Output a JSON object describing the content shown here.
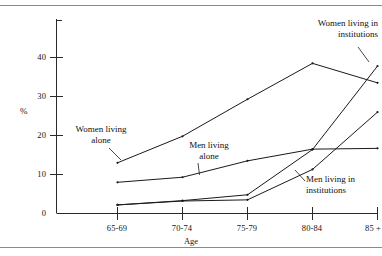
{
  "chart_data": {
    "type": "line",
    "title": "",
    "xlabel": "Age",
    "ylabel": "%",
    "categories": [
      "65-69",
      "70-74",
      "75-79",
      "80-84",
      "85 +"
    ],
    "ylim": [
      0,
      48
    ],
    "xlim": [
      0,
      4
    ],
    "yticks": [
      0,
      10,
      20,
      30,
      40
    ],
    "ytick_labels": [
      "0",
      "10",
      "20",
      "30",
      "40"
    ],
    "grid": false,
    "legend": "annotations-inline",
    "series": [
      {
        "name": "Women living alone",
        "values": [
          13.0,
          19.8,
          29.3,
          38.5,
          33.5
        ],
        "color": "#1a1a1a"
      },
      {
        "name": "Men living alone",
        "values": [
          8.0,
          9.3,
          13.5,
          16.5,
          16.7
        ],
        "color": "#1a1a1a"
      },
      {
        "name": "Women living in institutions",
        "values": [
          2.2,
          3.3,
          4.8,
          16.4,
          37.8
        ],
        "color": "#1a1a1a"
      },
      {
        "name": "Men living in institutions",
        "values": [
          2.2,
          3.2,
          3.5,
          11.3,
          26.0
        ],
        "color": "#1a1a1a"
      }
    ],
    "annotations": [
      {
        "id": "women-alone",
        "line1": "Women living",
        "line2": "alone"
      },
      {
        "id": "men-alone",
        "line1": "Men living",
        "line2": "alone"
      },
      {
        "id": "women-institutions",
        "line1": "Women living in",
        "line2": "institutions"
      },
      {
        "id": "men-institutions",
        "line1": "Men living in",
        "line2": "institutions"
      }
    ]
  },
  "axis": {
    "y": {
      "t0": "0",
      "t10": "10",
      "t20": "20",
      "t30": "30",
      "t40": "40",
      "label": "%"
    },
    "x": {
      "c0": "65-69",
      "c1": "70-74",
      "c2": "75-79",
      "c3": "80-84",
      "c4": "85 +",
      "label": "Age"
    }
  }
}
